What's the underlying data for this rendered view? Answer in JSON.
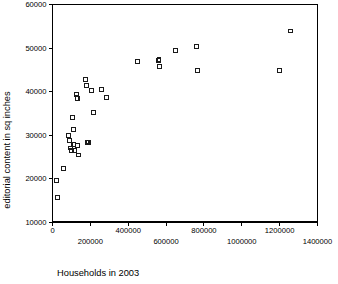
{
  "chart_data": {
    "type": "scatter",
    "title": "",
    "xlabel": "Households in 2003",
    "ylabel": "editorial content in sq inches",
    "xlim": [
      0,
      1400000
    ],
    "ylim": [
      10000,
      60000
    ],
    "grid": false,
    "legend": null,
    "marker": "open-square",
    "marker_color": "#1a1a1a",
    "xticks": [
      0,
      200000,
      400000,
      600000,
      800000,
      1000000,
      1200000,
      1400000
    ],
    "xtick_labels": [
      "0",
      "200000",
      "400000",
      "600000",
      "800000",
      "1000000",
      "1200000",
      "1400000"
    ],
    "xtick_label_style": "staggered-two-rows",
    "yticks": [
      10000,
      20000,
      30000,
      40000,
      50000,
      60000
    ],
    "ytick_labels": [
      "10000",
      "20000",
      "30000",
      "40000",
      "50000",
      "60000"
    ],
    "series": [
      {
        "name": "newspapers",
        "points": [
          [
            21000,
            19600
          ],
          [
            26000,
            15700
          ],
          [
            58000,
            22300
          ],
          [
            84000,
            29900
          ],
          [
            89000,
            28700
          ],
          [
            95000,
            27000
          ],
          [
            100000,
            26500
          ],
          [
            105000,
            34000
          ],
          [
            110000,
            31200
          ],
          [
            113000,
            27800
          ],
          [
            118000,
            26400
          ],
          [
            126000,
            39400
          ],
          [
            130000,
            38400
          ],
          [
            132000,
            27600
          ],
          [
            137000,
            25400
          ],
          [
            176000,
            42700
          ],
          [
            180000,
            41300
          ],
          [
            182000,
            28400
          ],
          [
            186000,
            28200
          ],
          [
            190000,
            28300
          ],
          [
            205000,
            40300
          ],
          [
            215000,
            35100
          ],
          [
            258000,
            40500
          ],
          [
            287000,
            38700
          ],
          [
            450000,
            46900
          ],
          [
            560000,
            47200
          ],
          [
            563000,
            47400
          ],
          [
            566000,
            45700
          ],
          [
            650000,
            49400
          ],
          [
            760000,
            50300
          ],
          [
            768000,
            44800
          ],
          [
            1200000,
            44900
          ],
          [
            1258000,
            53900
          ]
        ]
      }
    ]
  },
  "axes": {
    "x_axis_name": "x-axis",
    "y_axis_name": "y-axis"
  }
}
